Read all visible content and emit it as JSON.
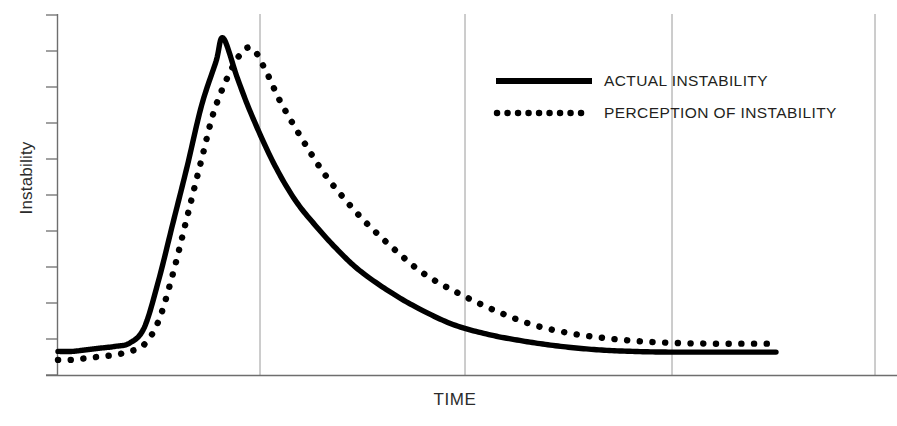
{
  "chart_data": {
    "type": "line",
    "title": "",
    "subtitle": "",
    "xlabel": "TIME",
    "ylabel": "Instability",
    "grid": true,
    "grid_orientation": "vertical",
    "xlim": [
      0,
      100
    ],
    "ylim": [
      0,
      100
    ],
    "xticks": [],
    "yticks": [],
    "y_tick_count": 11,
    "x_gridlines": [
      28,
      57,
      86,
      115
    ],
    "legend_position": "upper-right",
    "annotations": [],
    "series": [
      {
        "name": "ACTUAL INSTABILITY",
        "style": "solid",
        "color": "#000000",
        "x": [
          0,
          2,
          4,
          6,
          8,
          10,
          12,
          14,
          16,
          18,
          20,
          22,
          23,
          25,
          27,
          30,
          33,
          36,
          39,
          42,
          46,
          50,
          55,
          60,
          65,
          70,
          75,
          80,
          85,
          90,
          95,
          100
        ],
        "y": [
          7,
          7,
          7.5,
          8,
          8.5,
          9.5,
          14,
          28,
          45,
          62,
          80,
          93,
          100,
          88,
          77,
          63,
          52,
          44,
          37,
          31,
          25,
          20,
          15,
          12,
          10,
          8.5,
          7.5,
          7,
          6.8,
          6.8,
          6.8,
          6.8
        ]
      },
      {
        "name": "PERCEPTION OF INSTABILITY",
        "style": "dotted",
        "color": "#000000",
        "x": [
          0,
          2,
          4,
          6,
          8,
          10,
          12,
          14,
          16,
          18,
          20,
          22,
          25,
          27,
          29,
          31,
          34,
          37,
          40,
          43,
          47,
          51,
          56,
          61,
          66,
          71,
          76,
          81,
          86,
          91,
          96,
          100
        ],
        "y": [
          4.5,
          4.5,
          5,
          5.5,
          6,
          7,
          9,
          16,
          30,
          47,
          64,
          80,
          94,
          97,
          90,
          81,
          70,
          60,
          52,
          45,
          37,
          30,
          24,
          19,
          15,
          12.5,
          11,
          10,
          9.5,
          9.3,
          9.3,
          9.3
        ]
      }
    ]
  },
  "legend": {
    "items": [
      {
        "label": "ACTUAL INSTABILITY",
        "style": "solid"
      },
      {
        "label": "PERCEPTION OF INSTABILITY",
        "style": "dotted"
      }
    ]
  },
  "axes": {
    "x_title": "TIME",
    "y_title": "Instability"
  },
  "colors": {
    "ink": "#000000",
    "text": "#231f20",
    "grid": "#9a9a9a",
    "axis": "#6e6e6e",
    "background": "#ffffff"
  }
}
